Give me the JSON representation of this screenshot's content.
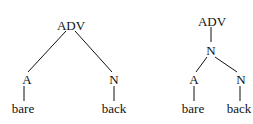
{
  "trees": [
    {
      "name": "flat-tree",
      "root": "ADV",
      "left_node": "A",
      "right_node": "N",
      "left_leaf": "bare",
      "right_leaf": "back"
    },
    {
      "name": "nested-tree",
      "root": "ADV",
      "mid_node": "N",
      "left_node": "A",
      "right_node": "N",
      "left_leaf": "bare",
      "right_leaf": "back"
    }
  ]
}
